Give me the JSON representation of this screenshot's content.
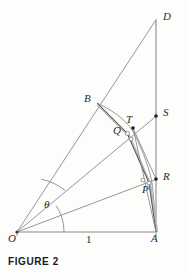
{
  "figure": {
    "caption": "FIGURE 2",
    "unit_length_label": "1",
    "angle_label": "θ",
    "background_color": "#fdfdfc",
    "line_color": "#6e6e6e",
    "heavy_line_color": "#4a4a4a",
    "label_color": "#2b2b2b",
    "points": [
      {
        "id": "O",
        "label": "O",
        "x": 17,
        "y": 232,
        "label_x": 8,
        "label_y": 236,
        "marker": "none"
      },
      {
        "id": "A",
        "label": "A",
        "x": 156,
        "y": 232,
        "label_x": 152,
        "label_y": 236,
        "marker": "none"
      },
      {
        "id": "D",
        "label": "D",
        "x": 156,
        "y": 20,
        "label_x": 162,
        "label_y": 12,
        "marker": "none"
      },
      {
        "id": "B",
        "label": "B",
        "x": 97,
        "y": 103,
        "label_x": 85,
        "label_y": 94,
        "marker": "none"
      },
      {
        "id": "S",
        "label": "S",
        "x": 156,
        "y": 116,
        "label_x": 162,
        "label_y": 108,
        "marker": "dot"
      },
      {
        "id": "T",
        "label": "T",
        "x": 133,
        "y": 128,
        "label_x": 127,
        "label_y": 116,
        "marker": "dot"
      },
      {
        "id": "Q",
        "label": "Q",
        "x": 127,
        "y": 133,
        "label_x": 114,
        "label_y": 126,
        "marker": "circle"
      },
      {
        "id": "R",
        "label": "R",
        "x": 156,
        "y": 179,
        "label_x": 162,
        "label_y": 172,
        "marker": "dot"
      },
      {
        "id": "P",
        "label": "P",
        "x": 149,
        "y": 183,
        "label_x": 143,
        "label_y": 185,
        "marker": "circle"
      }
    ],
    "segments": [
      {
        "name": "base-OA",
        "from": "O",
        "to": "A",
        "weight": "thin"
      },
      {
        "name": "vertical-DA",
        "from": "D",
        "to": "A",
        "weight": "thin"
      },
      {
        "name": "ray-OD",
        "from": "O",
        "to": "D",
        "weight": "thin"
      },
      {
        "name": "ray-OS",
        "from": "O",
        "to": "S",
        "weight": "thin"
      },
      {
        "name": "ray-OR",
        "from": "O",
        "to": "R",
        "weight": "thin"
      },
      {
        "name": "chord-BQ",
        "from": "B",
        "to": "Q",
        "weight": "heavy"
      },
      {
        "name": "chord-TR",
        "from": "T",
        "to": "R",
        "weight": "thin"
      },
      {
        "name": "chord-QP",
        "from": "Q",
        "to": "P",
        "weight": "heavy"
      },
      {
        "name": "chord-PA",
        "from": "P",
        "to": "A",
        "weight": "heavy"
      },
      {
        "name": "chord-TA",
        "from": "T",
        "to": "A",
        "weight": "thin"
      }
    ],
    "arcs": [
      {
        "name": "angle-arc-theta",
        "label": "θ",
        "radius": 47,
        "center": "O"
      },
      {
        "name": "angle-arc-inner",
        "radius": 58,
        "center": "O"
      },
      {
        "name": "involute-curve",
        "through": [
          "B",
          "Q",
          "P",
          "A"
        ]
      }
    ],
    "angle_label_position": {
      "x": 46,
      "y": 201
    },
    "unit_label_position": {
      "x": 87,
      "y": 236
    }
  }
}
